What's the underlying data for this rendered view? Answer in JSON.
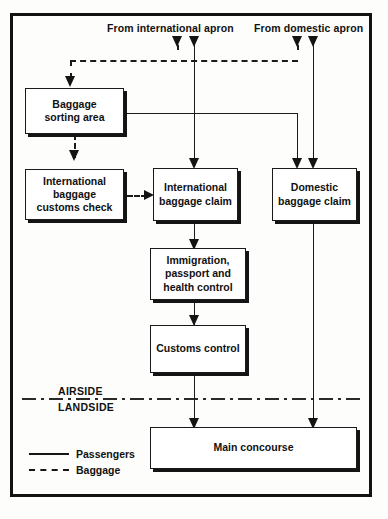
{
  "diagram": {
    "title_sources": [
      {
        "name": "international-apron",
        "label": "From international apron"
      },
      {
        "name": "domestic-apron",
        "label": "From domestic apron"
      }
    ],
    "nodes": [
      {
        "id": "baggage-sorting-area",
        "label": "Baggage\nsorting area"
      },
      {
        "id": "international-baggage-customs-check",
        "label": "International\nbaggage\ncustoms check"
      },
      {
        "id": "international-baggage-claim",
        "label": "International\nbaggage claim"
      },
      {
        "id": "domestic-baggage-claim",
        "label": "Domestic\nbaggage claim"
      },
      {
        "id": "immigration-passport-health-control",
        "label": "Immigration,\npassport and\nhealth control"
      },
      {
        "id": "customs-control",
        "label": "Customs control"
      },
      {
        "id": "main-concourse",
        "label": "Main concourse"
      }
    ],
    "zones": {
      "airside": "AIRSIDE",
      "landside": "LANDSIDE"
    },
    "legend": [
      {
        "style": "solid",
        "label": "Passengers"
      },
      {
        "style": "dashed",
        "label": "Baggage"
      }
    ],
    "colors": {
      "line": "#1b1b1b",
      "box_border": "#1a1a1a",
      "shadow": "#141414",
      "background": "#fdfdfc"
    }
  }
}
